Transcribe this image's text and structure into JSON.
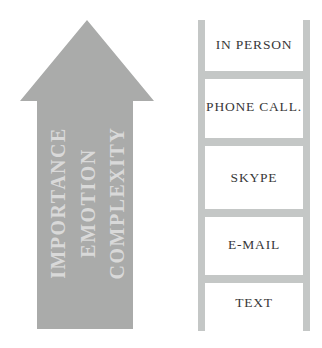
{
  "figure": {
    "type": "diagram"
  },
  "arrow": {
    "direction": "up",
    "labels": [
      "IMPORTANCE",
      "EMOTION",
      "COMPLEXITY"
    ]
  },
  "ladder": {
    "rungs": [
      "IN PERSON",
      "PHONE CALL.",
      "SKYPE",
      "E-MAIL",
      "TEXT"
    ]
  },
  "colors": {
    "arrow-fill": "#aaabaa",
    "arrow-text": "#d9d9d9",
    "ladder-gray": "#c4c7c6",
    "label-text": "#383838"
  }
}
